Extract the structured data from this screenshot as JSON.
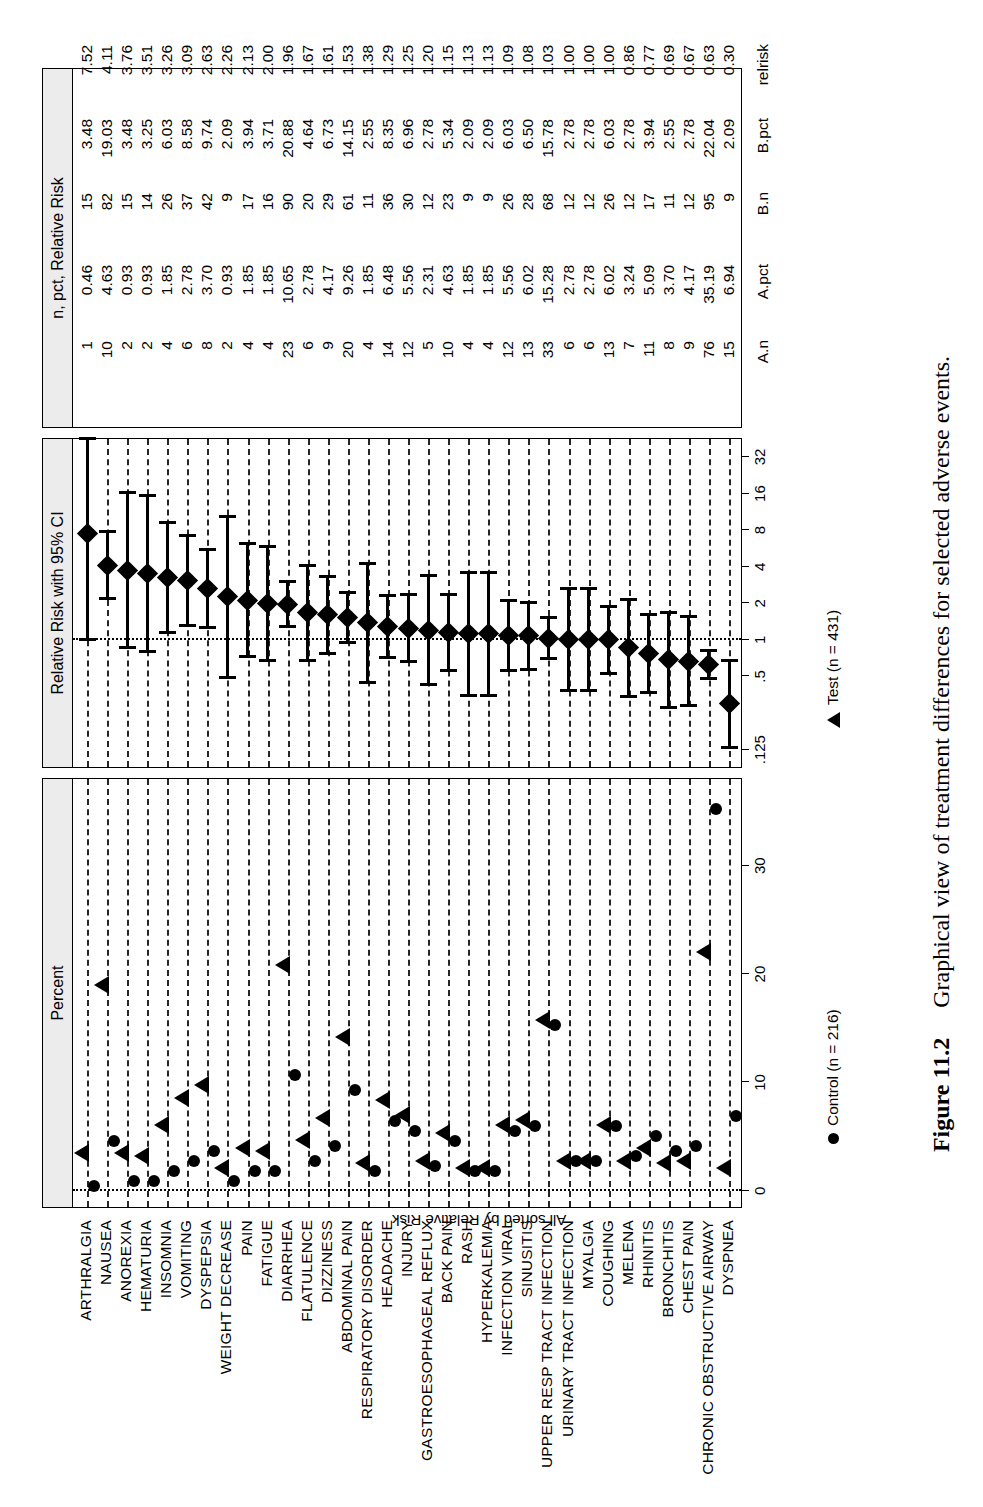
{
  "figure": {
    "caption_number": "Figure 11.2",
    "caption_text": "Graphical view of treatment differences for selected adverse events."
  },
  "panels": {
    "percent": {
      "strip_title": "Percent"
    },
    "relative_risk": {
      "strip_title": "Relative Risk with 95% CI"
    },
    "table": {
      "strip_title": "n, pct, Relative Risk"
    }
  },
  "y_axis_label": "All sorted by Relative Risk",
  "legend": [
    {
      "marker": "circle-marker",
      "label": "Control (n = 216)"
    },
    {
      "marker": "triangle-marker",
      "label": "Test (n = 431)"
    }
  ],
  "table_headers": [
    "A.n",
    "A.pct",
    "B.n",
    "B.pct",
    "relrisk"
  ],
  "chart_data": {
    "type": "scatter",
    "title": "Graphical view of treatment differences for selected adverse events.",
    "panel1": {
      "type": "scatter",
      "title": "Percent",
      "xlabel": "Percent",
      "xlim": [
        -1.5,
        38
      ],
      "xticks": [
        0,
        10,
        20,
        30
      ],
      "xtick_labels": [
        "0",
        "10",
        "20",
        "30"
      ],
      "series": [
        {
          "name": "Control (n = 216)",
          "marker": "circle"
        },
        {
          "name": "Test (n = 431)",
          "marker": "triangle"
        }
      ],
      "grid": "horizontal-dashed"
    },
    "panel2": {
      "type": "forest",
      "title": "Relative Risk with 95% CI",
      "xscale": "log2",
      "xlim": [
        0.09,
        45
      ],
      "xticks": [
        0.125,
        0.5,
        1,
        2,
        4,
        8,
        16,
        32
      ],
      "xtick_labels": [
        ".125",
        ".5",
        "1",
        "2",
        "4",
        "8",
        "16",
        "32"
      ],
      "reference_line": 1,
      "grid": "horizontal-dashed"
    },
    "categories": [
      "ARTHRALGIA",
      "NAUSEA",
      "ANOREXIA",
      "HEMATURIA",
      "INSOMNIA",
      "VOMITING",
      "DYSPEPSIA",
      "WEIGHT DECREASE",
      "PAIN",
      "FATIGUE",
      "DIARRHEA",
      "FLATULENCE",
      "DIZZINESS",
      "ABDOMINAL PAIN",
      "RESPIRATORY DISORDER",
      "HEADACHE",
      "INJURY",
      "GASTROESOPHAGEAL REFLUX",
      "BACK PAIN",
      "RASH",
      "HYPERKALEMIA",
      "INFECTION VIRAL",
      "SINUSITIS",
      "UPPER RESP TRACT INFECTION",
      "URINARY TRACT INFECTION",
      "MYALGIA",
      "COUGHING",
      "MELENA",
      "RHINITIS",
      "BRONCHITIS",
      "CHEST PAIN",
      "CHRONIC OBSTRUCTIVE AIRWAY",
      "DYSPNEA"
    ],
    "rows": [
      {
        "event": "ARTHRALGIA",
        "A_n": 1,
        "A_pct": 0.46,
        "B_n": 15,
        "B_pct": 3.48,
        "relrisk": 7.52,
        "ci_low": 1.0,
        "ci_high": 45.0
      },
      {
        "event": "NAUSEA",
        "A_n": 10,
        "A_pct": 4.63,
        "B_n": 82,
        "B_pct": 19.03,
        "relrisk": 4.11,
        "ci_low": 2.18,
        "ci_high": 7.75
      },
      {
        "event": "ANOREXIA",
        "A_n": 2,
        "A_pct": 0.93,
        "B_n": 15,
        "B_pct": 3.48,
        "relrisk": 3.76,
        "ci_low": 0.87,
        "ci_high": 16.2
      },
      {
        "event": "HEMATURIA",
        "A_n": 2,
        "A_pct": 0.93,
        "B_n": 14,
        "B_pct": 3.25,
        "relrisk": 3.51,
        "ci_low": 0.8,
        "ci_high": 15.3
      },
      {
        "event": "INSOMNIA",
        "A_n": 4,
        "A_pct": 1.85,
        "B_n": 26,
        "B_pct": 6.03,
        "relrisk": 3.26,
        "ci_low": 1.15,
        "ci_high": 9.22
      },
      {
        "event": "VOMITING",
        "A_n": 6,
        "A_pct": 2.78,
        "B_n": 37,
        "B_pct": 8.58,
        "relrisk": 3.09,
        "ci_low": 1.32,
        "ci_high": 7.22
      },
      {
        "event": "DYSPEPSIA",
        "A_n": 8,
        "A_pct": 3.7,
        "B_n": 42,
        "B_pct": 9.74,
        "relrisk": 2.63,
        "ci_low": 1.26,
        "ci_high": 5.5
      },
      {
        "event": "WEIGHT DECREASE",
        "A_n": 2,
        "A_pct": 0.93,
        "B_n": 9,
        "B_pct": 2.09,
        "relrisk": 2.26,
        "ci_low": 0.49,
        "ci_high": 10.3
      },
      {
        "event": "PAIN",
        "A_n": 4,
        "A_pct": 1.85,
        "B_n": 17,
        "B_pct": 3.94,
        "relrisk": 2.13,
        "ci_low": 0.73,
        "ci_high": 6.23
      },
      {
        "event": "FATIGUE",
        "A_n": 4,
        "A_pct": 1.85,
        "B_n": 16,
        "B_pct": 3.71,
        "relrisk": 2.0,
        "ci_low": 0.68,
        "ci_high": 5.9
      },
      {
        "event": "DIARRHEA",
        "A_n": 23,
        "A_pct": 10.65,
        "B_n": 90,
        "B_pct": 20.88,
        "relrisk": 1.96,
        "ci_low": 1.28,
        "ci_high": 3.0
      },
      {
        "event": "FLATULENCE",
        "A_n": 6,
        "A_pct": 2.78,
        "B_n": 20,
        "B_pct": 4.64,
        "relrisk": 1.67,
        "ci_low": 0.68,
        "ci_high": 4.09
      },
      {
        "event": "DIZZINESS",
        "A_n": 9,
        "A_pct": 4.17,
        "B_n": 29,
        "B_pct": 6.73,
        "relrisk": 1.61,
        "ci_low": 0.78,
        "ci_high": 3.34
      },
      {
        "event": "ABDOMINAL PAIN",
        "A_n": 20,
        "A_pct": 9.26,
        "B_n": 61,
        "B_pct": 14.15,
        "relrisk": 1.53,
        "ci_low": 0.95,
        "ci_high": 2.46
      },
      {
        "event": "RESPIRATORY DISORDER",
        "A_n": 4,
        "A_pct": 1.85,
        "B_n": 11,
        "B_pct": 2.55,
        "relrisk": 1.38,
        "ci_low": 0.45,
        "ci_high": 4.27
      },
      {
        "event": "HEADACHE",
        "A_n": 14,
        "A_pct": 6.48,
        "B_n": 36,
        "B_pct": 8.35,
        "relrisk": 1.29,
        "ci_low": 0.71,
        "ci_high": 2.34
      },
      {
        "event": "INJURY",
        "A_n": 12,
        "A_pct": 5.56,
        "B_n": 30,
        "B_pct": 6.96,
        "relrisk": 1.25,
        "ci_low": 0.66,
        "ci_high": 2.38
      },
      {
        "event": "GASTROESOPHAGEAL REFLUX",
        "A_n": 5,
        "A_pct": 2.31,
        "B_n": 12,
        "B_pct": 2.78,
        "relrisk": 1.2,
        "ci_low": 0.43,
        "ci_high": 3.37
      },
      {
        "event": "BACK PAIN",
        "A_n": 10,
        "A_pct": 4.63,
        "B_n": 23,
        "B_pct": 5.34,
        "relrisk": 1.15,
        "ci_low": 0.56,
        "ci_high": 2.37
      },
      {
        "event": "RASH",
        "A_n": 4,
        "A_pct": 1.85,
        "B_n": 9,
        "B_pct": 2.09,
        "relrisk": 1.13,
        "ci_low": 0.35,
        "ci_high": 3.62
      },
      {
        "event": "HYPERKALEMIA",
        "A_n": 4,
        "A_pct": 1.85,
        "B_n": 9,
        "B_pct": 2.09,
        "relrisk": 1.13,
        "ci_low": 0.35,
        "ci_high": 3.62
      },
      {
        "event": "INFECTION VIRAL",
        "A_n": 12,
        "A_pct": 5.56,
        "B_n": 26,
        "B_pct": 6.03,
        "relrisk": 1.09,
        "ci_low": 0.56,
        "ci_high": 2.11
      },
      {
        "event": "SINUSITIS",
        "A_n": 13,
        "A_pct": 6.02,
        "B_n": 28,
        "B_pct": 6.5,
        "relrisk": 1.08,
        "ci_low": 0.57,
        "ci_high": 2.03
      },
      {
        "event": "UPPER RESP TRACT INFECTION",
        "A_n": 33,
        "A_pct": 15.28,
        "B_n": 68,
        "B_pct": 15.78,
        "relrisk": 1.03,
        "ci_low": 0.7,
        "ci_high": 1.52
      },
      {
        "event": "URINARY TRACT INFECTION",
        "A_n": 6,
        "A_pct": 2.78,
        "B_n": 12,
        "B_pct": 2.78,
        "relrisk": 1.0,
        "ci_low": 0.38,
        "ci_high": 2.63
      },
      {
        "event": "MYALGIA",
        "A_n": 6,
        "A_pct": 2.78,
        "B_n": 12,
        "B_pct": 2.78,
        "relrisk": 1.0,
        "ci_low": 0.38,
        "ci_high": 2.63
      },
      {
        "event": "COUGHING",
        "A_n": 13,
        "A_pct": 6.02,
        "B_n": 26,
        "B_pct": 6.03,
        "relrisk": 1.0,
        "ci_low": 0.53,
        "ci_high": 1.89
      },
      {
        "event": "MELENA",
        "A_n": 7,
        "A_pct": 3.24,
        "B_n": 12,
        "B_pct": 2.78,
        "relrisk": 0.86,
        "ci_low": 0.34,
        "ci_high": 2.14
      },
      {
        "event": "RHINITIS",
        "A_n": 11,
        "A_pct": 5.09,
        "B_n": 17,
        "B_pct": 3.94,
        "relrisk": 0.77,
        "ci_low": 0.37,
        "ci_high": 1.62
      },
      {
        "event": "BRONCHITIS",
        "A_n": 8,
        "A_pct": 3.7,
        "B_n": 11,
        "B_pct": 2.55,
        "relrisk": 0.69,
        "ci_low": 0.28,
        "ci_high": 1.69
      },
      {
        "event": "CHEST PAIN",
        "A_n": 9,
        "A_pct": 4.17,
        "B_n": 12,
        "B_pct": 2.78,
        "relrisk": 0.67,
        "ci_low": 0.29,
        "ci_high": 1.56
      },
      {
        "event": "CHRONIC OBSTRUCTIVE AIRWAY",
        "A_n": 76,
        "A_pct": 35.19,
        "B_n": 95,
        "B_pct": 22.04,
        "relrisk": 0.63,
        "ci_low": 0.48,
        "ci_high": 0.82
      },
      {
        "event": "DYSPNEA",
        "A_n": 15,
        "A_pct": 6.94,
        "B_n": 9,
        "B_pct": 2.09,
        "relrisk": 0.3,
        "ci_low": 0.13,
        "ci_high": 0.68
      }
    ]
  }
}
